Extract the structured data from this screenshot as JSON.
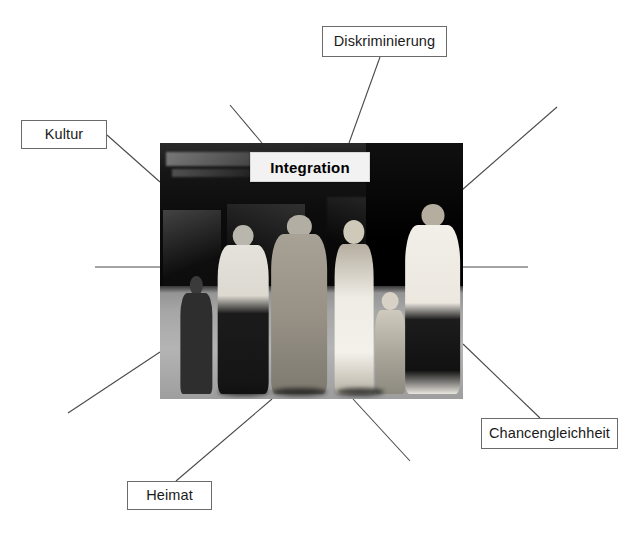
{
  "page": {
    "type": "mind-map",
    "width": 635,
    "height": 537,
    "background_color": "#ffffff",
    "line_color": "#4a4a4a",
    "box_border_color": "#6b6b6b"
  },
  "center": {
    "label": "Integration",
    "image_alt": "black-and-white street photograph of a diverse group of pedestrians in a city shopping street",
    "image_rect": {
      "x": 160,
      "y": 143,
      "width": 303,
      "height": 256
    },
    "label_rect": {
      "x": 250,
      "y": 152,
      "width": 120,
      "height": 30
    }
  },
  "nodes": [
    {
      "id": "diskriminierung",
      "label": "Diskriminierung",
      "rect": {
        "x": 322,
        "y": 26,
        "width": 125,
        "height": 31
      },
      "connector": {
        "x1": 380,
        "y1": 57,
        "x2": 349,
        "y2": 143
      }
    },
    {
      "id": "kultur",
      "label": "Kultur",
      "rect": {
        "x": 21,
        "y": 120,
        "width": 86,
        "height": 29
      },
      "connector": {
        "x1": 107,
        "y1": 135,
        "x2": 160,
        "y2": 182
      }
    },
    {
      "id": "chancengleichheit",
      "label": "Chancengleichheit",
      "rect": {
        "x": 481,
        "y": 418,
        "width": 137,
        "height": 31
      },
      "connector": {
        "x1": 540,
        "y1": 418,
        "x2": 463,
        "y2": 344
      }
    },
    {
      "id": "heimat",
      "label": "Heimat",
      "rect": {
        "x": 127,
        "y": 481,
        "width": 85,
        "height": 29
      },
      "connector": {
        "x1": 176,
        "y1": 481,
        "x2": 272,
        "y2": 399
      }
    }
  ],
  "unlabeled_connectors": [
    {
      "id": "top-left-spoke",
      "x1": 230,
      "y1": 105,
      "x2": 262,
      "y2": 143
    },
    {
      "id": "top-right-spoke",
      "x1": 557,
      "y1": 107,
      "x2": 462,
      "y2": 190
    },
    {
      "id": "left-spoke",
      "x1": 95,
      "y1": 267,
      "x2": 160,
      "y2": 267
    },
    {
      "id": "right-spoke",
      "x1": 463,
      "y1": 267,
      "x2": 528,
      "y2": 267
    },
    {
      "id": "bottom-left-spoke",
      "x1": 68,
      "y1": 413,
      "x2": 160,
      "y2": 352
    },
    {
      "id": "bottom-right-spoke",
      "x1": 353,
      "y1": 399,
      "x2": 410,
      "y2": 461
    }
  ]
}
